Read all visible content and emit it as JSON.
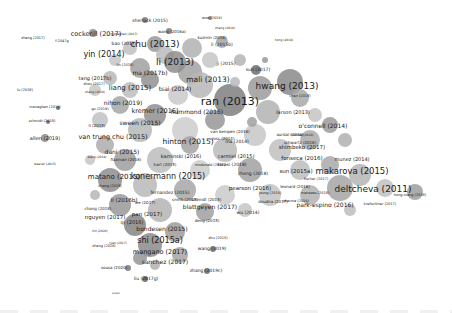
{
  "diagram": {
    "type": "bibliographic-coupling-network",
    "node_color": "#8a8a8a",
    "label_color": "#1a1a1a",
    "labels": [
      {
        "text": "cockerill (2017)",
        "x": 96,
        "y": 34,
        "size": 6.5
      },
      {
        "text": "f-2047g",
        "x": 62,
        "y": 42,
        "size": 3.5
      },
      {
        "text": "sherlock (2015)",
        "x": 150,
        "y": 21,
        "size": 4.5
      },
      {
        "text": "woo (2019)",
        "x": 212,
        "y": 19,
        "size": 3.5
      },
      {
        "text": "zhang (2018)",
        "x": 225,
        "y": 28,
        "size": 3
      },
      {
        "text": "wang (2016a)",
        "x": 172,
        "y": 32,
        "size": 4
      },
      {
        "text": "kuzmin (2018)",
        "x": 212,
        "y": 38,
        "size": 4
      },
      {
        "text": "li (2015b)",
        "x": 222,
        "y": 45,
        "size": 4.5
      },
      {
        "text": "bao (2017)",
        "x": 124,
        "y": 44,
        "size": 4.5
      },
      {
        "text": "chu (2013)",
        "x": 155,
        "y": 44,
        "size": 9
      },
      {
        "text": "monaghan (2017)",
        "x": 124,
        "y": 34,
        "size": 3
      },
      {
        "text": "yin (2014)",
        "x": 104,
        "y": 55,
        "size": 8
      },
      {
        "text": "li (2013)",
        "x": 175,
        "y": 62,
        "size": 9
      },
      {
        "text": "ji (2015)",
        "x": 226,
        "y": 64,
        "size": 4.5
      },
      {
        "text": "ma (2017b)",
        "x": 150,
        "y": 73,
        "size": 6
      },
      {
        "text": "mali (2013)",
        "x": 208,
        "y": 80,
        "size": 7.5
      },
      {
        "text": "tang (2017b)",
        "x": 95,
        "y": 78,
        "size": 5
      },
      {
        "text": "zhou (2017)",
        "x": 94,
        "y": 85,
        "size": 3.5
      },
      {
        "text": "zhang (2018)",
        "x": 95,
        "y": 92,
        "size": 3
      },
      {
        "text": "liang (2015)",
        "x": 130,
        "y": 88,
        "size": 7
      },
      {
        "text": "tsai (2014)",
        "x": 175,
        "y": 89,
        "size": 6
      },
      {
        "text": "hwang (2013)",
        "x": 287,
        "y": 86,
        "size": 9
      },
      {
        "text": "ran (2013)",
        "x": 230,
        "y": 101,
        "size": 11
      },
      {
        "text": "sun (2017)",
        "x": 258,
        "y": 70,
        "size": 4.5
      },
      {
        "text": "nihon (2019)",
        "x": 123,
        "y": 103,
        "size": 6
      },
      {
        "text": "lu (2018)",
        "x": 25,
        "y": 91,
        "size": 3.5
      },
      {
        "text": "hammond (2016)",
        "x": 197,
        "y": 112,
        "size": 6
      },
      {
        "text": "kremer (2016)",
        "x": 155,
        "y": 111,
        "size": 6.5
      },
      {
        "text": "larson (2013)",
        "x": 293,
        "y": 112,
        "size": 5
      },
      {
        "text": "chen (2018)",
        "x": 300,
        "y": 97,
        "size": 3.5
      },
      {
        "text": "monaghan (2019)",
        "x": 45,
        "y": 108,
        "size": 3.5
      },
      {
        "text": "gu (2019)",
        "x": 100,
        "y": 110,
        "size": 3.5
      },
      {
        "text": "schmidt (2018)",
        "x": 42,
        "y": 122,
        "size": 3.5
      },
      {
        "text": "sween (2015)",
        "x": 140,
        "y": 123,
        "size": 6
      },
      {
        "text": "li (2015)",
        "x": 97,
        "y": 126,
        "size": 4
      },
      {
        "text": "o'connell (2014)",
        "x": 323,
        "y": 126,
        "size": 6
      },
      {
        "text": "allen (2019)",
        "x": 45,
        "y": 138,
        "size": 5
      },
      {
        "text": "van kempen (2016)",
        "x": 230,
        "y": 132,
        "size": 4
      },
      {
        "text": "van trung chu (2015)",
        "x": 113,
        "y": 137,
        "size": 6.5
      },
      {
        "text": "hinton (2015)",
        "x": 188,
        "y": 142,
        "size": 7.5
      },
      {
        "text": "cross (2014)",
        "x": 222,
        "y": 139,
        "size": 4
      },
      {
        "text": "aurdal (2016)",
        "x": 290,
        "y": 135,
        "size": 4
      },
      {
        "text": "mendez (2018)",
        "x": 302,
        "y": 135,
        "size": 3
      },
      {
        "text": "schwartz (2016)",
        "x": 300,
        "y": 143,
        "size": 4
      },
      {
        "text": "shimbeko (2017)",
        "x": 302,
        "y": 148,
        "size": 5.5
      },
      {
        "text": "ma (2014)",
        "x": 237,
        "y": 142,
        "size": 4.5
      },
      {
        "text": "dani (2015)",
        "x": 122,
        "y": 152,
        "size": 6
      },
      {
        "text": "flaxman (2016)",
        "x": 126,
        "y": 160,
        "size": 4
      },
      {
        "text": "kaminski (2016)",
        "x": 181,
        "y": 156,
        "size": 5
      },
      {
        "text": "carmiel (2015)",
        "x": 236,
        "y": 156,
        "size": 5
      },
      {
        "text": "fonseca (2016)",
        "x": 302,
        "y": 159,
        "size": 5.5
      },
      {
        "text": "munez (2014)",
        "x": 352,
        "y": 159,
        "size": 5
      },
      {
        "text": "kwasi (2018)",
        "x": 232,
        "y": 165,
        "size": 4.5
      },
      {
        "text": "hart (2015)",
        "x": 165,
        "y": 165,
        "size": 4
      },
      {
        "text": "sun (2015a)",
        "x": 296,
        "y": 172,
        "size": 5.5
      },
      {
        "text": "makarova (2015)",
        "x": 352,
        "y": 171,
        "size": 8.5
      },
      {
        "text": "mcdonald (2017)",
        "x": 210,
        "y": 166,
        "size": 3.5
      },
      {
        "text": "weaver (2015)",
        "x": 45,
        "y": 164,
        "size": 3
      },
      {
        "text": "matano (2015)",
        "x": 114,
        "y": 177,
        "size": 7
      },
      {
        "text": "konermann (2015)",
        "x": 168,
        "y": 177,
        "size": 8
      },
      {
        "text": "cheng (2018)",
        "x": 253,
        "y": 174,
        "size": 4.5
      },
      {
        "text": "fischer (2017)",
        "x": 316,
        "y": 180,
        "size": 3.5
      },
      {
        "text": "pearson (2016)",
        "x": 250,
        "y": 189,
        "size": 5.5
      },
      {
        "text": "leonard (2016)",
        "x": 295,
        "y": 187,
        "size": 4
      },
      {
        "text": "fernandez (2015)",
        "x": 170,
        "y": 193,
        "size": 4.5
      },
      {
        "text": "chang (2018)",
        "x": 110,
        "y": 187,
        "size": 3.5
      },
      {
        "text": "deltcheva (2011)",
        "x": 373,
        "y": 189,
        "size": 9
      },
      {
        "text": "joung (2015)",
        "x": 270,
        "y": 194,
        "size": 3.5
      },
      {
        "text": "li (2016b)",
        "x": 124,
        "y": 201,
        "size": 5.5
      },
      {
        "text": "chang (2018)",
        "x": 98,
        "y": 209,
        "size": 4
      },
      {
        "text": "lee (2017)",
        "x": 145,
        "y": 203,
        "size": 4
      },
      {
        "text": "smith (2015)",
        "x": 185,
        "y": 200,
        "size": 4
      },
      {
        "text": "schmidt (2015)",
        "x": 206,
        "y": 200,
        "size": 4
      },
      {
        "text": "doudna (2017)",
        "x": 273,
        "y": 202,
        "size": 4
      },
      {
        "text": "sharma (2016)",
        "x": 296,
        "y": 202,
        "size": 3.5
      },
      {
        "text": "menezes (2018)",
        "x": 315,
        "y": 194,
        "size": 3.5
      },
      {
        "text": "hong-xiang (2018)",
        "x": 410,
        "y": 196,
        "size": 3.5
      },
      {
        "text": "krefschiner (2017)",
        "x": 380,
        "y": 205,
        "size": 3.5
      },
      {
        "text": "park-espino (2016)",
        "x": 325,
        "y": 205,
        "size": 6
      },
      {
        "text": "nguyen (2017)",
        "x": 105,
        "y": 218,
        "size": 5.5
      },
      {
        "text": "pan (2017)",
        "x": 147,
        "y": 215,
        "size": 5.5
      },
      {
        "text": "qi (2016)",
        "x": 132,
        "y": 222,
        "size": 5
      },
      {
        "text": "blattgeyen (2017)",
        "x": 210,
        "y": 207,
        "size": 6
      },
      {
        "text": "wu (2014)",
        "x": 248,
        "y": 213,
        "size": 4.5
      },
      {
        "text": "deng (2015)",
        "x": 207,
        "y": 221,
        "size": 4
      },
      {
        "text": "hill (2020)",
        "x": 100,
        "y": 231,
        "size": 3
      },
      {
        "text": "bondesen (2015)",
        "x": 162,
        "y": 229,
        "size": 6
      },
      {
        "text": "zhu (2015)",
        "x": 218,
        "y": 239,
        "size": 3.5
      },
      {
        "text": "shi (2015a)",
        "x": 160,
        "y": 241,
        "size": 8
      },
      {
        "text": "zhang (2019)",
        "x": 104,
        "y": 247,
        "size": 3.5
      },
      {
        "text": "wang (2019)",
        "x": 212,
        "y": 249,
        "size": 4.5
      },
      {
        "text": "mangano (2017)",
        "x": 160,
        "y": 252,
        "size": 6.5
      },
      {
        "text": "ryan (2017)",
        "x": 118,
        "y": 243,
        "size": 3
      },
      {
        "text": "sanchez (2017)",
        "x": 165,
        "y": 262,
        "size": 6
      },
      {
        "text": "zhang (2019c)",
        "x": 206,
        "y": 271,
        "size": 4.5
      },
      {
        "text": "sousa (2020)",
        "x": 114,
        "y": 268,
        "size": 4
      },
      {
        "text": "liu (2017g)",
        "x": 146,
        "y": 279,
        "size": 4.5
      },
      {
        "text": "wilson",
        "x": 116,
        "y": 294,
        "size": 2.5
      },
      {
        "text": "wang (2018)",
        "x": 97,
        "y": 157,
        "size": 3
      },
      {
        "text": "hong (2018)",
        "x": 284,
        "y": 40,
        "size": 3
      },
      {
        "text": "zhang (2017)",
        "x": 33,
        "y": 39,
        "size": 3.5
      },
      {
        "text": "lin (2018)",
        "x": 125,
        "y": 66,
        "size": 3.5
      }
    ],
    "nodes": [
      {
        "x": 93,
        "y": 33,
        "r": 4,
        "shade": "#8c8c8c"
      },
      {
        "x": 145,
        "y": 20,
        "r": 3,
        "shade": "#7a7a7a"
      },
      {
        "x": 210,
        "y": 18,
        "r": 2,
        "shade": "#777777"
      },
      {
        "x": 169,
        "y": 31,
        "r": 3,
        "shade": "#7d7d7d"
      },
      {
        "x": 192,
        "y": 48,
        "r": 10,
        "shade": "#b1b1b1"
      },
      {
        "x": 222,
        "y": 42,
        "r": 6,
        "shade": "#a5a5a5"
      },
      {
        "x": 155,
        "y": 44,
        "r": 8,
        "shade": "#9a9a9a"
      },
      {
        "x": 130,
        "y": 48,
        "r": 7,
        "shade": "#c0c0c0"
      },
      {
        "x": 165,
        "y": 55,
        "r": 9,
        "shade": "#bbbbbb"
      },
      {
        "x": 190,
        "y": 72,
        "r": 12,
        "shade": "#a2a2a2"
      },
      {
        "x": 175,
        "y": 62,
        "r": 11,
        "shade": "#8e8e8e"
      },
      {
        "x": 210,
        "y": 60,
        "r": 8,
        "shade": "#c5c5c5"
      },
      {
        "x": 240,
        "y": 60,
        "r": 6,
        "shade": "#b4b4b4"
      },
      {
        "x": 256,
        "y": 70,
        "r": 5,
        "shade": "#6e6e6e"
      },
      {
        "x": 115,
        "y": 60,
        "r": 6,
        "shade": "#c6c6c6"
      },
      {
        "x": 140,
        "y": 68,
        "r": 10,
        "shade": "#a0a0a0"
      },
      {
        "x": 110,
        "y": 78,
        "r": 7,
        "shade": "#b8b8b8"
      },
      {
        "x": 150,
        "y": 80,
        "r": 9,
        "shade": "#909090"
      },
      {
        "x": 130,
        "y": 90,
        "r": 8,
        "shade": "#bdbdbd"
      },
      {
        "x": 200,
        "y": 85,
        "r": 13,
        "shade": "#b6b6b6"
      },
      {
        "x": 178,
        "y": 95,
        "r": 10,
        "shade": "#c9c9c9"
      },
      {
        "x": 230,
        "y": 100,
        "r": 16,
        "shade": "#7f7f7f"
      },
      {
        "x": 260,
        "y": 88,
        "r": 12,
        "shade": "#9b9b9b"
      },
      {
        "x": 290,
        "y": 82,
        "r": 13,
        "shade": "#8a8a8a"
      },
      {
        "x": 300,
        "y": 98,
        "r": 9,
        "shade": "#a8a8a8"
      },
      {
        "x": 268,
        "y": 112,
        "r": 12,
        "shade": "#b3b3b3"
      },
      {
        "x": 315,
        "y": 115,
        "r": 7,
        "shade": "#c4c4c4"
      },
      {
        "x": 330,
        "y": 125,
        "r": 8,
        "shade": "#9a9a9a"
      },
      {
        "x": 345,
        "y": 140,
        "r": 7,
        "shade": "#b0b0b0"
      },
      {
        "x": 310,
        "y": 140,
        "r": 10,
        "shade": "#ababab"
      },
      {
        "x": 255,
        "y": 135,
        "r": 11,
        "shade": "#c7c7c7"
      },
      {
        "x": 155,
        "y": 115,
        "r": 11,
        "shade": "#8f8f8f"
      },
      {
        "x": 120,
        "y": 105,
        "r": 9,
        "shade": "#a6a6a6"
      },
      {
        "x": 100,
        "y": 120,
        "r": 8,
        "shade": "#c2c2c2"
      },
      {
        "x": 140,
        "y": 130,
        "r": 12,
        "shade": "#b7b7b7"
      },
      {
        "x": 185,
        "y": 130,
        "r": 13,
        "shade": "#cdcdcd"
      },
      {
        "x": 215,
        "y": 120,
        "r": 10,
        "shade": "#979797"
      },
      {
        "x": 190,
        "y": 145,
        "r": 9,
        "shade": "#a3a3a3"
      },
      {
        "x": 225,
        "y": 150,
        "r": 12,
        "shade": "#bababa"
      },
      {
        "x": 280,
        "y": 150,
        "r": 11,
        "shade": "#c0c0c0"
      },
      {
        "x": 105,
        "y": 145,
        "r": 9,
        "shade": "#adadad"
      },
      {
        "x": 125,
        "y": 160,
        "r": 11,
        "shade": "#9e9e9e"
      },
      {
        "x": 160,
        "y": 160,
        "r": 13,
        "shade": "#bcbcbc"
      },
      {
        "x": 200,
        "y": 170,
        "r": 10,
        "shade": "#cbcbcb"
      },
      {
        "x": 250,
        "y": 170,
        "r": 12,
        "shade": "#a1a1a1"
      },
      {
        "x": 300,
        "y": 170,
        "r": 10,
        "shade": "#bdbdbd"
      },
      {
        "x": 330,
        "y": 165,
        "r": 9,
        "shade": "#a9a9a9"
      },
      {
        "x": 360,
        "y": 175,
        "r": 11,
        "shade": "#b5b5b5"
      },
      {
        "x": 340,
        "y": 188,
        "r": 13,
        "shade": "#a4a4a4"
      },
      {
        "x": 385,
        "y": 188,
        "r": 9,
        "shade": "#c1c1c1"
      },
      {
        "x": 415,
        "y": 192,
        "r": 8,
        "shade": "#9d9d9d"
      },
      {
        "x": 310,
        "y": 195,
        "r": 10,
        "shade": "#b2b2b2"
      },
      {
        "x": 270,
        "y": 195,
        "r": 11,
        "shade": "#c3c3c3"
      },
      {
        "x": 110,
        "y": 180,
        "r": 12,
        "shade": "#8d8d8d"
      },
      {
        "x": 145,
        "y": 185,
        "r": 12,
        "shade": "#b9b9b9"
      },
      {
        "x": 185,
        "y": 190,
        "r": 11,
        "shade": "#a7a7a7"
      },
      {
        "x": 225,
        "y": 195,
        "r": 10,
        "shade": "#cacaca"
      },
      {
        "x": 120,
        "y": 205,
        "r": 11,
        "shade": "#999999"
      },
      {
        "x": 160,
        "y": 210,
        "r": 12,
        "shade": "#b4b4b4"
      },
      {
        "x": 205,
        "y": 212,
        "r": 9,
        "shade": "#a0a0a0"
      },
      {
        "x": 245,
        "y": 210,
        "r": 7,
        "shade": "#c6c6c6"
      },
      {
        "x": 135,
        "y": 225,
        "r": 11,
        "shade": "#858585"
      },
      {
        "x": 175,
        "y": 232,
        "r": 10,
        "shade": "#9c9c9c"
      },
      {
        "x": 150,
        "y": 245,
        "r": 12,
        "shade": "#8b8b8b"
      },
      {
        "x": 180,
        "y": 255,
        "r": 8,
        "shade": "#a5a5a5"
      },
      {
        "x": 140,
        "y": 258,
        "r": 7,
        "shade": "#959595"
      },
      {
        "x": 155,
        "y": 265,
        "r": 5,
        "shade": "#b0b0b0"
      },
      {
        "x": 128,
        "y": 268,
        "r": 3,
        "shade": "#777777"
      },
      {
        "x": 145,
        "y": 279,
        "r": 3,
        "shade": "#5f5f5f"
      },
      {
        "x": 213,
        "y": 249,
        "r": 3,
        "shade": "#6d6d6d"
      },
      {
        "x": 207,
        "y": 271,
        "r": 3,
        "shade": "#6f6f6f"
      },
      {
        "x": 45,
        "y": 138,
        "r": 4,
        "shade": "#8e8e8e"
      },
      {
        "x": 58,
        "y": 108,
        "r": 2,
        "shade": "#666666"
      },
      {
        "x": 48,
        "y": 122,
        "r": 2,
        "shade": "#666666"
      },
      {
        "x": 95,
        "y": 90,
        "r": 6,
        "shade": "#c8c8c8"
      },
      {
        "x": 235,
        "y": 82,
        "r": 5,
        "shade": "#bababa"
      },
      {
        "x": 252,
        "y": 122,
        "r": 5,
        "shade": "#a0a0a0"
      },
      {
        "x": 265,
        "y": 60,
        "r": 3,
        "shade": "#999999"
      },
      {
        "x": 350,
        "y": 210,
        "r": 6,
        "shade": "#bdbdbd"
      },
      {
        "x": 95,
        "y": 195,
        "r": 5,
        "shade": "#b6b6b6"
      },
      {
        "x": 90,
        "y": 160,
        "r": 5,
        "shade": "#c5c5c5"
      }
    ]
  }
}
